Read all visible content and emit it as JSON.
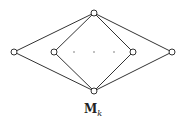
{
  "diagram": {
    "title": "M",
    "subscript": "k",
    "nodes": [
      {
        "id": "top",
        "x": 94,
        "y": 13
      },
      {
        "id": "left",
        "x": 14,
        "y": 52
      },
      {
        "id": "inner-left",
        "x": 54,
        "y": 52
      },
      {
        "id": "inner-right",
        "x": 133,
        "y": 52
      },
      {
        "id": "right",
        "x": 172,
        "y": 52
      },
      {
        "id": "bottom",
        "x": 94,
        "y": 91
      }
    ],
    "edges": [
      [
        "top",
        "left"
      ],
      [
        "top",
        "inner-left"
      ],
      [
        "top",
        "inner-right"
      ],
      [
        "top",
        "right"
      ],
      [
        "bottom",
        "left"
      ],
      [
        "bottom",
        "inner-left"
      ],
      [
        "bottom",
        "inner-right"
      ],
      [
        "bottom",
        "right"
      ]
    ],
    "ellipsis": [
      {
        "x": 74,
        "y": 52
      },
      {
        "x": 94,
        "y": 52
      },
      {
        "x": 114,
        "y": 52
      }
    ],
    "stroke_color": "#333333"
  }
}
